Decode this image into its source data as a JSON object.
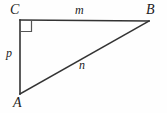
{
  "figure": {
    "kind": "right-triangle-diagram",
    "background_color": "#fefefe",
    "stroke_color": "#333333",
    "label_color": "#1c1c1c",
    "width": 167,
    "height": 113
  },
  "vertices": [
    {
      "id": "C",
      "label": "C",
      "x": 20,
      "y": 20,
      "label_x": 10,
      "label_y": 3
    },
    {
      "id": "B",
      "label": "B",
      "x": 149,
      "y": 21,
      "label_x": 146,
      "label_y": 3
    },
    {
      "id": "A",
      "label": "A",
      "x": 20,
      "y": 94,
      "label_x": 13,
      "label_y": 96
    }
  ],
  "sides": [
    {
      "id": "CB",
      "label": "m",
      "from": "C",
      "to": "B",
      "label_x": 75,
      "label_y": 4
    },
    {
      "id": "CA",
      "label": "p",
      "from": "C",
      "to": "A",
      "label_x": 6,
      "label_y": 47
    },
    {
      "id": "AB",
      "label": "n",
      "from": "A",
      "to": "B",
      "label_x": 79,
      "label_y": 59
    }
  ],
  "right_angle": {
    "at_vertex": "C",
    "marker": "square",
    "size": 11,
    "x": 20,
    "y": 20
  }
}
